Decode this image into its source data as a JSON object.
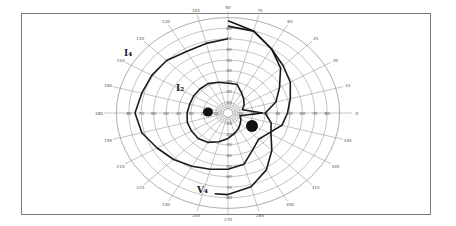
{
  "chart_data": {
    "type": "polar-perimetry",
    "title": "",
    "center_px": [
      228,
      113
    ],
    "px_per_10deg": {
      "horizontal": 12.4,
      "vertical": 10.6
    },
    "rings_deg": [
      10,
      20,
      30,
      40,
      50,
      60,
      70,
      80,
      90
    ],
    "meridians_deg": [
      0,
      15,
      30,
      45,
      60,
      75,
      90,
      105,
      120,
      135,
      150,
      165,
      180,
      195,
      210,
      225,
      240,
      255,
      270,
      285,
      300,
      315,
      330,
      345
    ],
    "meridian_labels": [
      {
        "angle": 0,
        "text": "0"
      },
      {
        "angle": 15,
        "text": "15"
      },
      {
        "angle": 30,
        "text": "30"
      },
      {
        "angle": 45,
        "text": "45"
      },
      {
        "angle": 60,
        "text": "60"
      },
      {
        "angle": 75,
        "text": "75"
      },
      {
        "angle": 90,
        "text": "90"
      },
      {
        "angle": 105,
        "text": "105"
      },
      {
        "angle": 120,
        "text": "120"
      },
      {
        "angle": 135,
        "text": "135"
      },
      {
        "angle": 150,
        "text": "150"
      },
      {
        "angle": 165,
        "text": "165"
      },
      {
        "angle": 180,
        "text": "180"
      },
      {
        "angle": 195,
        "text": "195"
      },
      {
        "angle": 210,
        "text": "210"
      },
      {
        "angle": 225,
        "text": "225"
      },
      {
        "angle": 240,
        "text": "240"
      },
      {
        "angle": 255,
        "text": "255"
      },
      {
        "angle": 270,
        "text": "270"
      },
      {
        "angle": 285,
        "text": "285"
      },
      {
        "angle": 300,
        "text": "300"
      },
      {
        "angle": 315,
        "text": "315"
      },
      {
        "angle": 330,
        "text": "330"
      },
      {
        "angle": 345,
        "text": "345"
      }
    ],
    "axis_tick_labels": {
      "horizontal_left": [
        "80",
        "70",
        "60",
        "50",
        "40",
        "30",
        "20",
        "10"
      ],
      "horizontal_right": [
        "10",
        "20",
        "30",
        "40",
        "50",
        "60",
        "70",
        "80"
      ],
      "vertical_up": [
        "10",
        "20",
        "30",
        "40",
        "50",
        "60",
        "70",
        "80"
      ],
      "vertical_down": [
        "10",
        "20",
        "30",
        "40",
        "50",
        "60",
        "70",
        "80"
      ]
    },
    "isopters": [
      {
        "name": "I4",
        "label": "I₄",
        "label_pos_px": [
          124,
          56
        ],
        "points_deg": [
          [
            90,
            70
          ],
          [
            105,
            68
          ],
          [
            120,
            67
          ],
          [
            135,
            70
          ],
          [
            150,
            71
          ],
          [
            165,
            72
          ],
          [
            180,
            75
          ],
          [
            195,
            72
          ],
          [
            210,
            66
          ],
          [
            225,
            62
          ],
          [
            240,
            58
          ],
          [
            255,
            55
          ],
          [
            270,
            53
          ],
          [
            285,
            50
          ],
          [
            300,
            40
          ],
          [
            315,
            35
          ],
          [
            330,
            38
          ],
          [
            345,
            45
          ],
          [
            0,
            48
          ],
          [
            15,
            52
          ],
          [
            30,
            58
          ],
          [
            45,
            63
          ],
          [
            60,
            70
          ],
          [
            75,
            80
          ],
          [
            90,
            82
          ]
        ]
      },
      {
        "name": "I2",
        "label": "I₂",
        "label_pos_px": [
          176,
          91
        ],
        "points_deg": [
          [
            90,
            28
          ],
          [
            105,
            30
          ],
          [
            120,
            32
          ],
          [
            135,
            32
          ],
          [
            150,
            32
          ],
          [
            165,
            32
          ],
          [
            180,
            33
          ],
          [
            195,
            34
          ],
          [
            210,
            34
          ],
          [
            225,
            34
          ],
          [
            240,
            32
          ],
          [
            255,
            28
          ],
          [
            270,
            24
          ],
          [
            285,
            20
          ],
          [
            300,
            17
          ],
          [
            315,
            14
          ],
          [
            330,
            12
          ],
          [
            345,
            10
          ],
          [
            0,
            28
          ],
          [
            15,
            12
          ],
          [
            30,
            15
          ],
          [
            45,
            18
          ],
          [
            60,
            22
          ],
          [
            75,
            28
          ],
          [
            90,
            28
          ]
        ]
      },
      {
        "name": "V4",
        "label": "V₄",
        "label_pos_px": [
          197,
          193
        ],
        "points_deg": [
          [
            90,
            87
          ],
          [
            75,
            80
          ],
          [
            60,
            70
          ],
          [
            45,
            60
          ],
          [
            30,
            48
          ],
          [
            15,
            40
          ],
          [
            0,
            30
          ],
          [
            345,
            36
          ],
          [
            330,
            40
          ],
          [
            315,
            50
          ],
          [
            300,
            62
          ],
          [
            285,
            72
          ],
          [
            270,
            77
          ],
          [
            262,
            77
          ]
        ]
      }
    ],
    "blind_spots": [
      {
        "center_px": [
          208,
          112
        ],
        "rx": 5,
        "ry": 4.5
      },
      {
        "center_px": [
          252,
          126
        ],
        "rx": 6,
        "ry": 6
      }
    ]
  }
}
